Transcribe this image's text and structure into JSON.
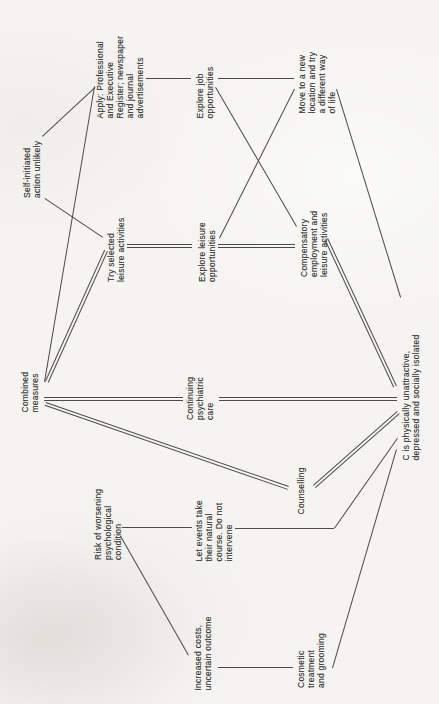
{
  "figure": {
    "type": "flowchart-scan",
    "orientation": "rotated-90-ccw",
    "palette": {
      "paper": "#f5f4f1",
      "ink": "#3a3a3a",
      "line": "#4a4a4a"
    }
  },
  "nodes": {
    "apply": {
      "text": "Apply: Professional\nand Executive\nRegister; newspaper\nand journal\nadvertisements"
    },
    "explore_job": {
      "text": "Explore job\nopportunities"
    },
    "self_initiated": {
      "text": "Self-initiated\naction unlikely"
    },
    "move": {
      "text": "Move to a new\nlocation and try\na different way\nof life"
    },
    "try_selected": {
      "text": "Try selected\nleisure activities"
    },
    "explore_leisure": {
      "text": "Explore leisure\nopportunities"
    },
    "combined": {
      "text": "Combined\nmeasures"
    },
    "continuing": {
      "text": "Continuing\npsychiatric\ncare"
    },
    "compensatory": {
      "text": "Compensatory\nemployment and\nleisure activities"
    },
    "c_problem": {
      "text": "C is physically unattractive,\ndepressed and socially isolated"
    },
    "risk": {
      "text": "Risk of worsening\npsychological\ncondition"
    },
    "let_events": {
      "text": "Let events take\ntheir natural\ncourse. Do not\nintervene"
    },
    "increased": {
      "text": "Increased costs,\nuncertain outcome"
    },
    "counselling": {
      "text": "Counselling"
    },
    "cosmetic": {
      "text": "Cosmetic\ntreatment\nand grooming"
    }
  },
  "edges": [
    {
      "from": "apply",
      "to": "explore_job",
      "style": "single"
    },
    {
      "from": "explore_job",
      "to": "move",
      "style": "single"
    },
    {
      "from": "explore_job",
      "to": "compensatory",
      "style": "single"
    },
    {
      "from": "explore_leisure",
      "to": "move",
      "style": "single"
    },
    {
      "from": "try_selected",
      "to": "explore_leisure",
      "style": "double"
    },
    {
      "from": "explore_leisure",
      "to": "compensatory",
      "style": "double"
    },
    {
      "from": "self_initiated",
      "to": "apply",
      "style": "single"
    },
    {
      "from": "self_initiated",
      "to": "try_selected",
      "style": "single"
    },
    {
      "from": "combined",
      "to": "apply",
      "style": "single"
    },
    {
      "from": "combined",
      "to": "try_selected",
      "style": "double"
    },
    {
      "from": "combined",
      "to": "continuing",
      "style": "double"
    },
    {
      "from": "continuing",
      "to": "c_problem",
      "style": "double"
    },
    {
      "from": "combined",
      "to": "counselling",
      "style": "double"
    },
    {
      "from": "counselling",
      "to": "c_problem",
      "style": "double"
    },
    {
      "from": "compensatory",
      "to": "c_problem",
      "style": "double"
    },
    {
      "from": "move",
      "to": "c_problem",
      "style": "single"
    },
    {
      "from": "let_events",
      "to": "c_problem",
      "style": "single",
      "bend": true
    },
    {
      "from": "cosmetic",
      "to": "c_problem",
      "style": "single"
    },
    {
      "from": "increased",
      "to": "cosmetic",
      "style": "single"
    },
    {
      "from": "risk",
      "to": "increased",
      "style": "single"
    },
    {
      "from": "risk",
      "to": "let_events",
      "style": "single"
    }
  ]
}
